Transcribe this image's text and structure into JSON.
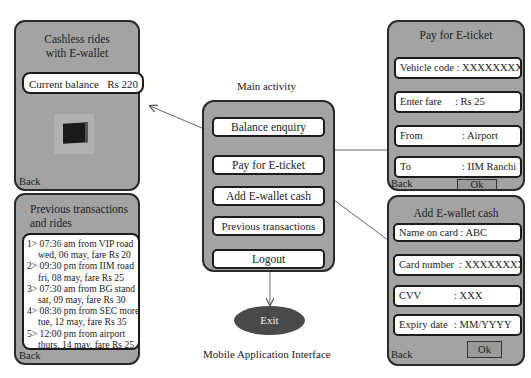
{
  "diagram_title": "Mobile Application Interface",
  "main_activity": {
    "caption": "Main activity",
    "buttons": [
      "Balance enquiry",
      "Pay for E-ticket",
      "Add E-wallet cash",
      "Previous transactions",
      "Logout"
    ]
  },
  "exit": {
    "label": "Exit"
  },
  "balance_screen": {
    "title_line1": "Cashless rides",
    "title_line2": "with E-wallet",
    "balance_label": "Current balance",
    "balance_value": "Rs 220",
    "image": "wallet-icon",
    "back_label": "Back"
  },
  "transactions_screen": {
    "title_line1": "Previous transactions",
    "title_line2": "and rides",
    "items": [
      {
        "line1": "1> 07:36 am from VIP road",
        "line2": "wed, 06 may, fare Rs 20"
      },
      {
        "line1": "2> 09:30 pm from IIM road",
        "line2": "fri, 08 may, fare Rs 25"
      },
      {
        "line1": "3> 07:30 am from BG stand",
        "line2": "sat, 09 may, fare Rs 30"
      },
      {
        "line1": "4> 08:36 pm from SEC more",
        "line2": "tue, 12 may, fare Rs 35"
      },
      {
        "line1": "5> 12:00 pm from airport",
        "line2": "thurs, 14 may, fare Rs 25"
      }
    ],
    "back_label": "Back"
  },
  "eticket_screen": {
    "title": "Pay for E-ticket",
    "fields": [
      {
        "label": "Vehicle code",
        "value": ": XXXXXXXX"
      },
      {
        "label": "Enter fare",
        "value": ": Rs 25"
      },
      {
        "label": "From",
        "value": ": Airport"
      },
      {
        "label": "To",
        "value": ": IIM Ranchi"
      }
    ],
    "back_label": "Back",
    "ok_label": "Ok"
  },
  "wallet_cash_screen": {
    "title": "Add E-wallet cash",
    "fields": [
      {
        "label": "Name on card",
        "value": ": ABC"
      },
      {
        "label": "Card number",
        "value": ": XXXXXXXX"
      },
      {
        "label": "CVV",
        "value": ": XXX"
      },
      {
        "label": "Expiry date",
        "value": ": MM/YYYY"
      }
    ],
    "back_label": "Back",
    "ok_label": "Ok"
  },
  "colors": {
    "panel": "#a3a3a3",
    "border": "#2a2a2a",
    "field": "#ffffff",
    "exit": "#4a4a4a"
  }
}
